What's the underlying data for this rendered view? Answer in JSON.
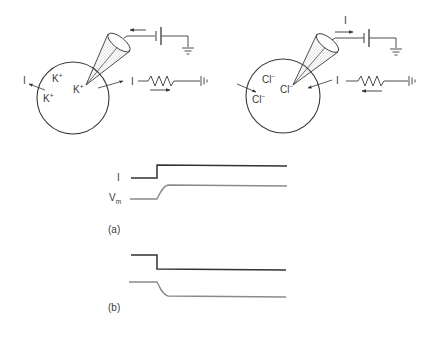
{
  "panels": {
    "left_cell": {
      "ion_labels": [
        "K",
        "K",
        "K"
      ],
      "ion_charge": "+",
      "current_label_out": "I",
      "current_label_resistor": "I"
    },
    "right_cell": {
      "ion_labels": [
        "Cl",
        "Cl",
        "Cl"
      ],
      "ion_charge": "−",
      "current_label_in": "I",
      "current_label_resistor": "I",
      "current_label_battery": "I"
    }
  },
  "traces": {
    "a": {
      "label": "(a)",
      "current_label": "I",
      "voltage_label": "V",
      "voltage_subscript": "m"
    },
    "b": {
      "label": "(b)"
    }
  },
  "colors": {
    "line": "#3a3a3a",
    "trace_current": "#333333",
    "trace_voltage": "#8a8a8a",
    "stipple": "#777777"
  }
}
